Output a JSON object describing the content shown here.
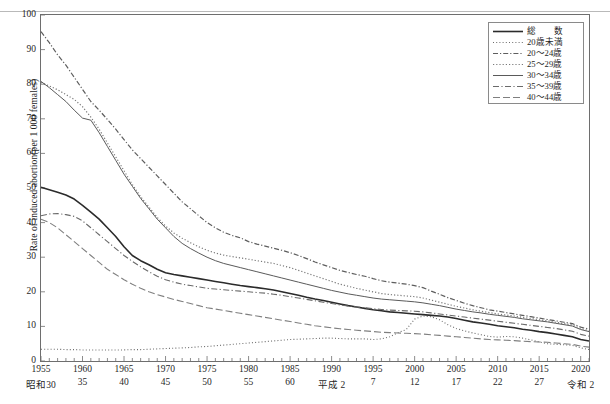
{
  "chart_data": {
    "type": "line",
    "title": "",
    "xlabel": "",
    "ylabel": "Rate of induced abortion(per 1 000 females)",
    "ylim": [
      0,
      100
    ],
    "xlim": [
      1955,
      2021
    ],
    "yticks": [
      0,
      10,
      20,
      30,
      40,
      50,
      60,
      70,
      80,
      90,
      100
    ],
    "grid": false,
    "legend_position": "top-right",
    "x_ticks_western": [
      "1955",
      "1960",
      "1965",
      "1970",
      "1975",
      "1980",
      "1985",
      "1990",
      "1995",
      "2000",
      "2005",
      "2010",
      "2015",
      "2020"
    ],
    "x_ticks_japanese": [
      "昭和30",
      "35",
      "40",
      "45",
      "50",
      "55",
      "60",
      "平成 2",
      "7",
      "12",
      "17",
      "22",
      "27",
      "令和 2"
    ],
    "x_tick_years": [
      1955,
      1960,
      1965,
      1970,
      1975,
      1980,
      1985,
      1990,
      1995,
      2000,
      2005,
      2010,
      2015,
      2020
    ],
    "x": [
      1955,
      1956,
      1957,
      1958,
      1959,
      1960,
      1961,
      1962,
      1963,
      1964,
      1965,
      1966,
      1967,
      1968,
      1969,
      1970,
      1971,
      1972,
      1973,
      1974,
      1975,
      1976,
      1977,
      1978,
      1979,
      1980,
      1981,
      1982,
      1983,
      1984,
      1985,
      1986,
      1987,
      1988,
      1989,
      1990,
      1991,
      1992,
      1993,
      1994,
      1995,
      1996,
      1997,
      1998,
      1999,
      2000,
      2001,
      2002,
      2003,
      2004,
      2005,
      2006,
      2007,
      2008,
      2009,
      2010,
      2011,
      2012,
      2013,
      2014,
      2015,
      2016,
      2017,
      2018,
      2019,
      2020,
      2021
    ],
    "series": [
      {
        "name": "総　　数",
        "key": "total",
        "style": "solid",
        "color": "#2b2b2b",
        "width": 1.6,
        "values": [
          50.2,
          49.5,
          48.8,
          48.0,
          46.8,
          45.0,
          43.0,
          41.0,
          38.5,
          36.0,
          33.0,
          30.5,
          29.0,
          27.8,
          26.5,
          25.5,
          25.0,
          24.6,
          24.2,
          23.8,
          23.4,
          23.0,
          22.6,
          22.2,
          21.8,
          21.5,
          21.2,
          20.9,
          20.5,
          20.0,
          19.5,
          19.0,
          18.4,
          17.9,
          17.5,
          17.0,
          16.5,
          16.0,
          15.6,
          15.2,
          14.8,
          14.5,
          14.2,
          14.0,
          13.8,
          13.6,
          13.4,
          13.2,
          13.0,
          12.7,
          12.3,
          11.8,
          11.3,
          11.0,
          10.6,
          10.2,
          9.9,
          9.6,
          9.2,
          8.9,
          8.5,
          8.2,
          7.8,
          7.4,
          7.0,
          6.2,
          5.8
        ]
      },
      {
        "name": "20歳未満",
        "key": "under20",
        "style": "dotted",
        "color": "#6b6b6b",
        "width": 1.1,
        "values": [
          3.4,
          3.4,
          3.4,
          3.3,
          3.3,
          3.2,
          3.2,
          3.2,
          3.2,
          3.2,
          3.2,
          3.3,
          3.3,
          3.4,
          3.5,
          3.6,
          3.7,
          3.8,
          3.9,
          4.1,
          4.2,
          4.4,
          4.6,
          4.8,
          5.0,
          5.2,
          5.4,
          5.6,
          5.8,
          6.0,
          6.2,
          6.3,
          6.4,
          6.5,
          6.6,
          6.6,
          6.5,
          6.4,
          6.4,
          6.4,
          6.2,
          6.4,
          7.0,
          8.2,
          9.1,
          12.1,
          13.0,
          12.8,
          11.9,
          10.5,
          9.4,
          8.7,
          8.1,
          7.6,
          7.1,
          6.9,
          7.1,
          7.0,
          6.6,
          6.1,
          5.5,
          5.0,
          4.8,
          4.7,
          4.5,
          3.8,
          3.3
        ]
      },
      {
        "name": "20～24歳",
        "key": "age20_24",
        "style": "dashdot",
        "color": "#5e5e5e",
        "width": 1.2,
        "values": [
          95.2,
          92.0,
          88.5,
          85.5,
          82.0,
          78.5,
          75.0,
          72.5,
          69.8,
          67.0,
          64.0,
          61.0,
          58.5,
          56.0,
          53.5,
          51.0,
          48.5,
          46.0,
          44.0,
          42.0,
          40.0,
          38.5,
          37.2,
          36.3,
          35.6,
          34.5,
          33.8,
          33.2,
          32.6,
          32.0,
          31.3,
          30.5,
          29.6,
          28.6,
          27.8,
          27.0,
          26.2,
          25.6,
          25.0,
          24.5,
          23.8,
          23.2,
          22.8,
          22.5,
          22.2,
          21.8,
          21.2,
          20.2,
          19.3,
          18.3,
          17.5,
          16.7,
          16.0,
          15.4,
          14.8,
          14.4,
          14.0,
          13.6,
          13.2,
          12.8,
          12.4,
          12.0,
          11.6,
          11.2,
          10.8,
          9.8,
          9.2
        ]
      },
      {
        "name": "25～29歳",
        "key": "age25_29",
        "style": "finedot",
        "color": "#7a7a7a",
        "width": 1.2,
        "values": [
          80.5,
          79.5,
          78.4,
          77.0,
          75.6,
          73.5,
          70.5,
          67.0,
          63.0,
          59.0,
          55.0,
          51.0,
          47.5,
          44.5,
          41.5,
          39.0,
          37.0,
          35.5,
          34.2,
          33.0,
          32.0,
          31.2,
          30.6,
          30.2,
          29.8,
          29.4,
          29.0,
          28.6,
          28.2,
          27.6,
          27.0,
          26.2,
          25.4,
          24.6,
          23.8,
          23.0,
          22.2,
          21.6,
          21.0,
          20.5,
          20.0,
          19.5,
          19.2,
          19.0,
          18.8,
          18.6,
          18.2,
          17.6,
          17.0,
          16.4,
          15.8,
          15.3,
          14.8,
          14.4,
          14.0,
          13.6,
          13.3,
          13.0,
          12.6,
          12.3,
          11.9,
          11.6,
          11.2,
          10.8,
          10.4,
          9.4,
          8.8
        ]
      },
      {
        "name": "30～34歳",
        "key": "age30_34",
        "style": "solid-thin",
        "color": "#5a5a5a",
        "width": 1.0,
        "values": [
          80.8,
          79.0,
          77.0,
          75.0,
          72.5,
          70.2,
          69.6,
          66.0,
          62.0,
          58.0,
          54.0,
          50.5,
          47.0,
          44.0,
          41.0,
          38.5,
          36.0,
          34.0,
          32.5,
          31.2,
          30.0,
          29.0,
          28.2,
          27.6,
          27.0,
          26.4,
          25.8,
          25.2,
          24.6,
          24.0,
          23.4,
          22.8,
          22.2,
          21.6,
          21.0,
          20.4,
          19.9,
          19.4,
          19.0,
          18.6,
          18.2,
          17.9,
          17.7,
          17.5,
          17.3,
          17.1,
          16.8,
          16.4,
          16.0,
          15.5,
          15.0,
          14.6,
          14.2,
          13.9,
          13.5,
          13.2,
          12.9,
          12.6,
          12.2,
          11.9,
          11.6,
          11.3,
          10.9,
          10.5,
          10.1,
          9.1,
          8.5
        ]
      },
      {
        "name": "35～39歳",
        "key": "age35_39",
        "style": "dashdot2",
        "color": "#6a6a6a",
        "width": 1.1,
        "values": [
          42.0,
          42.5,
          42.6,
          42.3,
          41.8,
          40.5,
          38.5,
          36.5,
          34.5,
          32.5,
          30.5,
          28.8,
          27.2,
          25.8,
          24.5,
          23.5,
          22.8,
          22.2,
          21.8,
          21.4,
          21.0,
          20.8,
          20.6,
          20.4,
          20.2,
          20.0,
          19.8,
          19.6,
          19.3,
          19.0,
          18.6,
          18.2,
          17.8,
          17.4,
          17.0,
          16.6,
          16.2,
          15.9,
          15.6,
          15.4,
          15.1,
          14.9,
          14.7,
          14.6,
          14.5,
          14.4,
          14.2,
          13.9,
          13.6,
          13.3,
          13.0,
          12.7,
          12.4,
          12.1,
          11.8,
          11.5,
          11.2,
          10.9,
          10.6,
          10.3,
          10.0,
          9.7,
          9.4,
          9.0,
          8.6,
          7.7,
          7.2
        ]
      },
      {
        "name": "40～44歳",
        "key": "age40_44",
        "style": "dashlong",
        "color": "#7f7f7f",
        "width": 1.1,
        "values": [
          41.0,
          40.0,
          38.5,
          36.5,
          34.5,
          32.5,
          30.5,
          28.5,
          26.5,
          25.0,
          23.5,
          22.2,
          21.0,
          20.0,
          19.2,
          18.5,
          17.8,
          17.2,
          16.6,
          16.0,
          15.4,
          15.0,
          14.6,
          14.2,
          13.8,
          13.4,
          13.0,
          12.6,
          12.2,
          11.8,
          11.4,
          11.0,
          10.6,
          10.2,
          9.9,
          9.6,
          9.3,
          9.1,
          8.9,
          8.7,
          8.5,
          8.3,
          8.2,
          8.1,
          8.0,
          7.9,
          7.8,
          7.6,
          7.4,
          7.2,
          7.0,
          6.8,
          6.6,
          6.4,
          6.2,
          6.1,
          6.0,
          5.9,
          5.7,
          5.6,
          5.5,
          5.4,
          5.2,
          5.0,
          4.8,
          4.3,
          4.0
        ]
      }
    ]
  },
  "axis": {
    "y_label": "Rate of induced abortion(per 1 000 females)",
    "y_ticks": [
      "100",
      "90",
      "80",
      "70",
      "60",
      "50",
      "40",
      "30",
      "20",
      "10",
      "0"
    ]
  },
  "legend": {
    "items": [
      {
        "label": "総　　数",
        "style": "solid"
      },
      {
        "label": "20歳未満",
        "style": "dotted"
      },
      {
        "label": "20～24歳",
        "style": "dashdot"
      },
      {
        "label": "25～29歳",
        "style": "finedot"
      },
      {
        "label": "30～34歳",
        "style": "solid-thin"
      },
      {
        "label": "35～39歳",
        "style": "dashdot2"
      },
      {
        "label": "40～44歳",
        "style": "dashlong"
      }
    ]
  }
}
